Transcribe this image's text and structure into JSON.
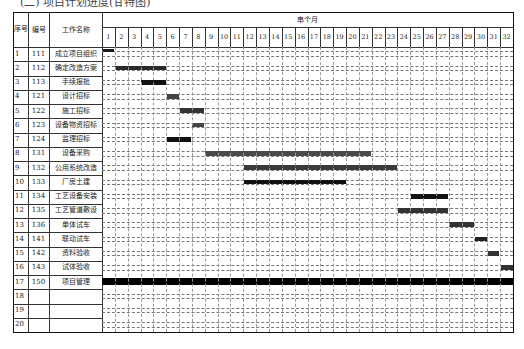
{
  "caption": "(二) 项目计划进度(甘特图)",
  "header": {
    "seq_label": "序号",
    "code_label": "编号",
    "name_label": "工作名称",
    "period_label": "串个月",
    "months": [
      "1",
      "2",
      "3",
      "4",
      "5",
      "6",
      "7",
      "8",
      "9",
      "10",
      "11",
      "12",
      "13",
      "14",
      "15",
      "16",
      "17",
      "18",
      "19",
      "20",
      "21",
      "22",
      "23",
      "24",
      "25",
      "26",
      "27",
      "28",
      "29",
      "30",
      "31",
      "32"
    ]
  },
  "rows": [
    {
      "seq": "1",
      "code": "111",
      "name": "成立项目组织",
      "bar": {
        "start": 1,
        "end": 1,
        "style": "thin-top",
        "color": "#1a1a1a"
      }
    },
    {
      "seq": "2",
      "code": "112",
      "name": "确定改造方案",
      "bar": {
        "start": 2,
        "end": 5,
        "style": "normal",
        "color": "#2a2a2a"
      }
    },
    {
      "seq": "3",
      "code": "113",
      "name": "手续报批",
      "bar": {
        "start": 4,
        "end": 5,
        "style": "normal",
        "color": "#111111"
      }
    },
    {
      "seq": "4",
      "code": "121",
      "name": "设计招标",
      "bar": {
        "start": 6,
        "end": 6,
        "style": "normal",
        "color": "#444444"
      }
    },
    {
      "seq": "5",
      "code": "122",
      "name": "施工招标",
      "bar": {
        "start": 7,
        "end": 8,
        "style": "normal",
        "color": "#333333"
      }
    },
    {
      "seq": "6",
      "code": "123",
      "name": "设备物资招标",
      "bar": {
        "start": 8,
        "end": 8,
        "style": "normal",
        "color": "#444444"
      }
    },
    {
      "seq": "7",
      "code": "124",
      "name": "监理招标",
      "bar": {
        "start": 6,
        "end": 7,
        "style": "normal",
        "color": "#111111"
      }
    },
    {
      "seq": "8",
      "code": "131",
      "name": "设备采购",
      "bar": {
        "start": 9,
        "end": 21,
        "style": "normal",
        "color": "#4a4a4a"
      }
    },
    {
      "seq": "9",
      "code": "132",
      "name": "公用系统改造",
      "bar": {
        "start": 12,
        "end": 23,
        "style": "normal",
        "color": "#3a3a3a"
      }
    },
    {
      "seq": "10",
      "code": "133",
      "name": "厂房土建",
      "bar": {
        "start": 12,
        "end": 19,
        "style": "normal",
        "color": "#111111"
      }
    },
    {
      "seq": "11",
      "code": "134",
      "name": "工艺设备安装",
      "bar": {
        "start": 25,
        "end": 27,
        "style": "normal",
        "color": "#111111"
      }
    },
    {
      "seq": "12",
      "code": "135",
      "name": "工艺管道敷设",
      "bar": {
        "start": 24,
        "end": 27,
        "style": "normal",
        "color": "#333333"
      }
    },
    {
      "seq": "13",
      "code": "136",
      "name": "单体试车",
      "bar": {
        "start": 28,
        "end": 29,
        "style": "normal",
        "color": "#333333"
      }
    },
    {
      "seq": "14",
      "code": "141",
      "name": "联动试车",
      "bar": {
        "start": 30,
        "end": 30,
        "style": "normal",
        "color": "#222222"
      }
    },
    {
      "seq": "15",
      "code": "142",
      "name": "资料验收",
      "bar": {
        "start": 31,
        "end": 31,
        "style": "short",
        "color": "#333333"
      }
    },
    {
      "seq": "16",
      "code": "143",
      "name": "试体验收",
      "bar": {
        "start": 32,
        "end": 32,
        "style": "normal",
        "color": "#333333"
      }
    },
    {
      "seq": "17",
      "code": "150",
      "name": "项目管理",
      "bar": {
        "start": 1,
        "end": 32,
        "style": "thick",
        "color": "#000000"
      }
    },
    {
      "seq": "18",
      "code": "",
      "name": "",
      "bar": null
    },
    {
      "seq": "19",
      "code": "",
      "name": "",
      "bar": null
    },
    {
      "seq": "20",
      "code": "",
      "name": "",
      "bar": null
    }
  ],
  "chart_data": {
    "type": "gantt",
    "title": "项目计划进度",
    "x_unit": "月",
    "x_label": "串个月",
    "x_range": [
      1,
      32
    ],
    "tasks": [
      {
        "seq": 1,
        "code": "111",
        "name": "成立项目组织",
        "start": 1,
        "end": 1
      },
      {
        "seq": 2,
        "code": "112",
        "name": "确定改造方案",
        "start": 2,
        "end": 5
      },
      {
        "seq": 3,
        "code": "113",
        "name": "手续报批",
        "start": 4,
        "end": 5
      },
      {
        "seq": 4,
        "code": "121",
        "name": "设计招标",
        "start": 6,
        "end": 6
      },
      {
        "seq": 5,
        "code": "122",
        "name": "施工招标",
        "start": 7,
        "end": 8
      },
      {
        "seq": 6,
        "code": "123",
        "name": "设备物资招标",
        "start": 8,
        "end": 8
      },
      {
        "seq": 7,
        "code": "124",
        "name": "监理招标",
        "start": 6,
        "end": 7
      },
      {
        "seq": 8,
        "code": "131",
        "name": "设备采购",
        "start": 9,
        "end": 21
      },
      {
        "seq": 9,
        "code": "132",
        "name": "公用系统改造",
        "start": 12,
        "end": 23
      },
      {
        "seq": 10,
        "code": "133",
        "name": "厂房土建",
        "start": 12,
        "end": 19
      },
      {
        "seq": 11,
        "code": "134",
        "name": "工艺设备安装",
        "start": 25,
        "end": 27
      },
      {
        "seq": 12,
        "code": "135",
        "name": "工艺管道敷设",
        "start": 24,
        "end": 27
      },
      {
        "seq": 13,
        "code": "136",
        "name": "单体试车",
        "start": 28,
        "end": 29
      },
      {
        "seq": 14,
        "code": "141",
        "name": "联动试车",
        "start": 30,
        "end": 30
      },
      {
        "seq": 15,
        "code": "142",
        "name": "资料验收",
        "start": 31,
        "end": 31
      },
      {
        "seq": 16,
        "code": "143",
        "name": "试体验收",
        "start": 32,
        "end": 32
      },
      {
        "seq": 17,
        "code": "150",
        "name": "项目管理",
        "start": 1,
        "end": 32
      }
    ]
  }
}
